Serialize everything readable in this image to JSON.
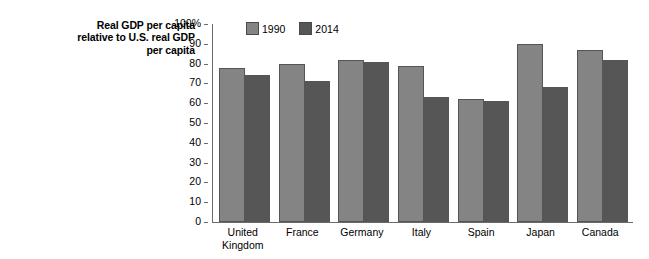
{
  "axis_title": {
    "line1": "Real GDP per capita",
    "line2": "relative to U.S. real GDP",
    "line3": "per capita"
  },
  "legend": {
    "entries": [
      {
        "label": "1990",
        "color": "#848484"
      },
      {
        "label": "2014",
        "color": "#565656"
      }
    ]
  },
  "y_ticks": [
    {
      "label": "100%",
      "value": 100
    },
    {
      "label": "90",
      "value": 90
    },
    {
      "label": "80",
      "value": 80
    },
    {
      "label": "70",
      "value": 70
    },
    {
      "label": "60",
      "value": 60
    },
    {
      "label": "50",
      "value": 50
    },
    {
      "label": "40",
      "value": 40
    },
    {
      "label": "30",
      "value": 30
    },
    {
      "label": "20",
      "value": 20
    },
    {
      "label": "10",
      "value": 10
    },
    {
      "label": "0",
      "value": 0
    }
  ],
  "categories_display": [
    {
      "line1": "United",
      "line2": "Kingdom"
    },
    {
      "line1": "France",
      "line2": ""
    },
    {
      "line1": "Germany",
      "line2": ""
    },
    {
      "line1": "Italy",
      "line2": ""
    },
    {
      "line1": "Spain",
      "line2": ""
    },
    {
      "line1": "Japan",
      "line2": ""
    },
    {
      "line1": "Canada",
      "line2": ""
    }
  ],
  "chart_data": {
    "type": "bar",
    "title": "",
    "xlabel": "",
    "ylabel": "Real GDP per capita relative to U.S. real GDP per capita",
    "ylim": [
      0,
      100
    ],
    "ytick_interval": 10,
    "yunit": "%",
    "grid": false,
    "legend_position": "top-left-inside",
    "categories": [
      "United Kingdom",
      "France",
      "Germany",
      "Italy",
      "Spain",
      "Japan",
      "Canada"
    ],
    "series": [
      {
        "name": "1990",
        "color": "#848484",
        "values": [
          78,
          80,
          82,
          79,
          62,
          90,
          87
        ]
      },
      {
        "name": "2014",
        "color": "#565656",
        "values": [
          74,
          71,
          81,
          63,
          61,
          68,
          82
        ]
      }
    ]
  }
}
